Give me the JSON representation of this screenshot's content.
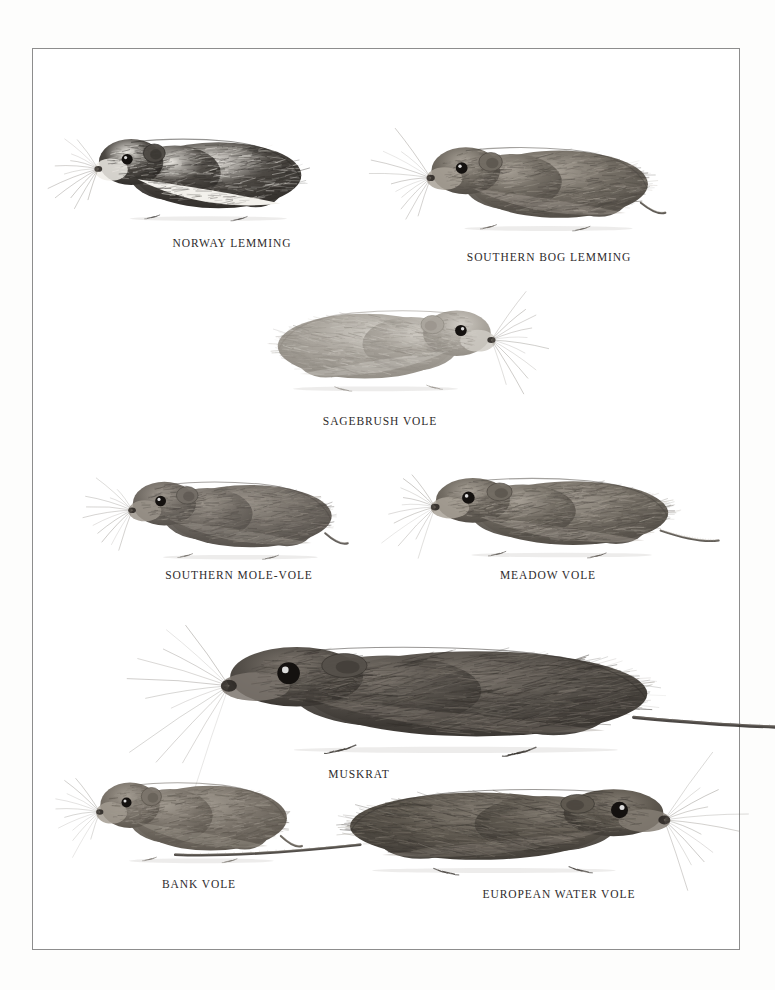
{
  "plate": {
    "background_color": "#fdfdfc",
    "page_color": "#ffffff",
    "frame_color": "#8d8d8d",
    "caption_color": "#2e2b2c",
    "medium": "graphite-pencil-illustration",
    "title": ""
  },
  "figures": [
    {
      "id": "norway-lemming",
      "caption": "NORWAY LEMMING",
      "facing": "left",
      "has_tail": false,
      "pelage": "dark-dorsal-pale-ventral",
      "x": 92,
      "y": 118,
      "w": 230,
      "h": 110,
      "caption_x": 152,
      "caption_y": 237,
      "caption_w": 160
    },
    {
      "id": "southern-bog-lemming",
      "caption": "SOUTHERN BOG LEMMING",
      "facing": "left",
      "has_tail": true,
      "pelage": "uniform-grey-brown",
      "x": 424,
      "y": 126,
      "w": 246,
      "h": 112,
      "caption_x": 456,
      "caption_y": 251,
      "caption_w": 186
    },
    {
      "id": "sagebrush-vole",
      "caption": "SAGEBRUSH VOLE",
      "facing": "right",
      "has_tail": false,
      "pelage": "pale-silvery-grey",
      "x": 256,
      "y": 290,
      "w": 242,
      "h": 108,
      "caption_x": 300,
      "caption_y": 415,
      "caption_w": 160
    },
    {
      "id": "southern-mole-vole",
      "caption": "SOUTHERN MOLE-VOLE",
      "facing": "left",
      "has_tail": true,
      "pelage": "uniform-mid-grey",
      "x": 126,
      "y": 462,
      "w": 226,
      "h": 104,
      "caption_x": 144,
      "caption_y": 569,
      "caption_w": 190
    },
    {
      "id": "meadow-vole",
      "caption": "MEADOW VOLE",
      "facing": "left",
      "has_tail": true,
      "pelage": "uniform-grey-brown",
      "x": 428,
      "y": 458,
      "w": 264,
      "h": 106,
      "caption_x": 474,
      "caption_y": 569,
      "caption_w": 148
    },
    {
      "id": "muskrat",
      "caption": "MUSKRAT",
      "facing": "left",
      "has_tail": true,
      "pelage": "dark-brown-dense",
      "x": 216,
      "y": 620,
      "w": 474,
      "h": 142,
      "caption_x": 304,
      "caption_y": 768,
      "caption_w": 110
    },
    {
      "id": "bank-vole",
      "caption": "BANK VOLE",
      "facing": "left",
      "has_tail": true,
      "pelage": "mid-grey-brown",
      "x": 94,
      "y": 762,
      "w": 212,
      "h": 108,
      "caption_x": 134,
      "caption_y": 878,
      "caption_w": 130
    },
    {
      "id": "european-water-vole",
      "caption": "EUROPEAN WATER VOLE",
      "facing": "right",
      "has_tail": true,
      "pelage": "dark-grey-brown",
      "x": 318,
      "y": 768,
      "w": 356,
      "h": 112,
      "caption_x": 464,
      "caption_y": 888,
      "caption_w": 190
    }
  ]
}
